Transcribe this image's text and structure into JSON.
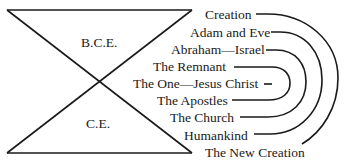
{
  "diagram": {
    "hourglass": {
      "top_label": "B.C.E.",
      "bottom_label": "C.E."
    },
    "items": [
      {
        "label": "Creation",
        "x": 205,
        "y": 19,
        "dash_x1": 256,
        "dash_x2": 268
      },
      {
        "label": "Adam and Eve",
        "x": 190,
        "y": 37,
        "dash_x1": 271,
        "dash_x2": 281
      },
      {
        "label": "Abraham—Israel",
        "x": 171,
        "y": 54,
        "dash_x1": 266,
        "dash_x2": 276
      },
      {
        "label": "The Remnant",
        "x": 153,
        "y": 71,
        "dash_x1": 234,
        "dash_x2": 250
      },
      {
        "label": "The One—Jesus Christ",
        "x": 133,
        "y": 88,
        "dash_x1": 264,
        "dash_x2": 271
      },
      {
        "label": "The Apostles",
        "x": 157,
        "y": 105,
        "dash_x1": 232,
        "dash_x2": 250
      },
      {
        "label": "The Church",
        "x": 170,
        "y": 122,
        "dash_x1": 240,
        "dash_x2": 258
      },
      {
        "label": "Humankind",
        "x": 184,
        "y": 140,
        "dash_x1": 254,
        "dash_x2": 271
      },
      {
        "label": "The New Creation",
        "x": 205,
        "y": 157
      }
    ],
    "connections": [
      {
        "from": "Creation",
        "to": "The New Creation"
      },
      {
        "from": "Adam and Eve",
        "to": "Humankind"
      },
      {
        "from": "Abraham—Israel",
        "to": "The Church"
      },
      {
        "from": "The Remnant",
        "to": "The Apostles"
      }
    ],
    "colors": {
      "ink": "#1a1a1a",
      "background": "#ffffff"
    }
  }
}
